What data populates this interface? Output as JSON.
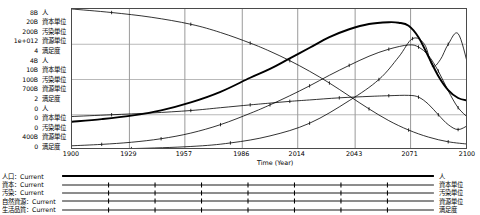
{
  "chart_data": {
    "type": "line",
    "title": "",
    "xlabel": "Time (Year)",
    "ylabel": "",
    "grid": true,
    "legend_position": "bottom",
    "xlim": [
      1900,
      2100
    ],
    "xticks": [
      1900,
      1929,
      1957,
      1986,
      2014,
      2043,
      2071,
      2100
    ],
    "axis_groups": [
      {
        "rows": [
          {
            "value": "8B",
            "unit": "人"
          },
          {
            "value": "20B",
            "unit": "資本単位"
          },
          {
            "value": "200B",
            "unit": "汚染単位"
          },
          {
            "value": "1e+012",
            "unit": "資源単位"
          },
          {
            "value": "4",
            "unit": "満足度"
          }
        ]
      },
      {
        "rows": [
          {
            "value": "4B",
            "unit": "人"
          },
          {
            "value": "10B",
            "unit": "資本単位"
          },
          {
            "value": "100B",
            "unit": "汚染単位"
          },
          {
            "value": "700B",
            "unit": "資源単位"
          },
          {
            "value": "2",
            "unit": "満足度"
          }
        ]
      },
      {
        "rows": [
          {
            "value": "0",
            "unit": "人"
          },
          {
            "value": "0",
            "unit": "資本単位"
          },
          {
            "value": "0",
            "unit": "汚染単位"
          },
          {
            "value": "400B",
            "unit": "資源単位"
          },
          {
            "value": "0",
            "unit": "満足度"
          }
        ]
      }
    ],
    "legend": [
      {
        "name": "人口：Current",
        "unit": "人",
        "color": "#000000",
        "width": 1.9,
        "markers": false
      },
      {
        "name": "資本：Current",
        "unit": "資本単位",
        "color": "#000000",
        "width": 0.8,
        "markers": true
      },
      {
        "name": "汚染：Current",
        "unit": "汚染単位",
        "color": "#000000",
        "width": 0.8,
        "markers": true
      },
      {
        "name": "自然資源：Current",
        "unit": "資源単位",
        "color": "#000000",
        "width": 0.8,
        "markers": true
      },
      {
        "name": "生活品質：Current",
        "unit": "満足度",
        "color": "#000000",
        "width": 0.8,
        "markers": true
      }
    ],
    "series": [
      {
        "name": "人口：Current",
        "unit": "人",
        "ylim": [
          0,
          8
        ],
        "x": [
          1900,
          1915,
          1930,
          1945,
          1960,
          1975,
          1990,
          2000,
          2010,
          2020,
          2030,
          2040,
          2050,
          2060,
          2065,
          2070,
          2075,
          2080,
          2085,
          2090,
          2095,
          2100
        ],
        "values": [
          1.6,
          1.75,
          1.95,
          2.25,
          2.7,
          3.3,
          4.1,
          4.6,
          5.2,
          5.8,
          6.4,
          6.85,
          7.15,
          7.25,
          7.22,
          7.05,
          6.4,
          5.3,
          4.2,
          3.4,
          2.95,
          2.8
        ]
      },
      {
        "name": "資本：Current",
        "unit": "資本単位",
        "ylim": [
          0,
          20
        ],
        "x": [
          1900,
          1915,
          1930,
          1945,
          1960,
          1975,
          1990,
          2000,
          2010,
          2020,
          2030,
          2040,
          2050,
          2060,
          2070,
          2075,
          2080,
          2085,
          2090,
          2095,
          2100
        ],
        "values": [
          0.6,
          0.8,
          1.1,
          1.6,
          2.4,
          3.6,
          5.2,
          6.4,
          7.7,
          9.1,
          10.6,
          12.0,
          13.3,
          14.3,
          14.9,
          14.6,
          13.4,
          11.2,
          8.4,
          6.0,
          4.6
        ]
      },
      {
        "name": "汚染：Current",
        "unit": "汚染単位",
        "ylim": [
          0,
          200
        ],
        "x": [
          1900,
          1930,
          1960,
          1980,
          2000,
          2020,
          2040,
          2055,
          2065,
          2072,
          2078,
          2082,
          2086,
          2090,
          2095,
          2100
        ],
        "values": [
          1,
          2,
          5,
          10,
          20,
          38,
          70,
          100,
          132,
          158,
          150,
          120,
          128,
          150,
          165,
          120
        ]
      },
      {
        "name": "自然資源：Current",
        "unit": "資源単位",
        "ylim": [
          400000000000,
          1000000000000
        ],
        "x": [
          1900,
          1920,
          1940,
          1960,
          1975,
          1990,
          2000,
          2010,
          2020,
          2030,
          2040,
          2050,
          2060,
          2070,
          2080,
          2090,
          2100
        ],
        "values": [
          1.0,
          0.985,
          0.965,
          0.935,
          0.9,
          0.855,
          0.82,
          0.78,
          0.735,
          0.685,
          0.63,
          0.575,
          0.525,
          0.485,
          0.455,
          0.435,
          0.425
        ]
      },
      {
        "name": "生活品質：Current",
        "unit": "満足度",
        "ylim": [
          0,
          4
        ],
        "x": [
          1900,
          1920,
          1940,
          1960,
          1975,
          1990,
          2000,
          2010,
          2020,
          2035,
          2050,
          2060,
          2070,
          2075,
          2080,
          2085,
          2090,
          2095,
          2100
        ],
        "values": [
          0.95,
          1.0,
          1.05,
          1.12,
          1.2,
          1.28,
          1.33,
          1.38,
          1.42,
          1.48,
          1.52,
          1.54,
          1.55,
          1.5,
          1.3,
          1.0,
          0.72,
          0.58,
          0.7
        ]
      }
    ]
  }
}
